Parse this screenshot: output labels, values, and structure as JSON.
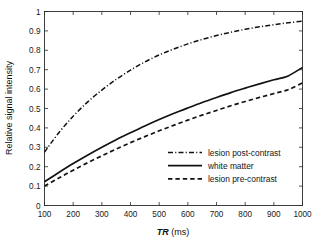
{
  "figure": {
    "background_color": "#ffffff",
    "line_color": "#121212"
  },
  "chart_data": {
    "type": "line",
    "title": "",
    "xlabel_italic": "TR",
    "xlabel_rest": " (ms)",
    "xlabel": "TR (ms)",
    "ylabel": "Relative signal intensity",
    "xlim": [
      100,
      1000
    ],
    "ylim": [
      0,
      1
    ],
    "grid": false,
    "legend_position": "lower right inside axes",
    "xticks": [
      100,
      200,
      300,
      400,
      500,
      600,
      700,
      800,
      900,
      1000
    ],
    "xticklabels": [
      "100",
      "200",
      "300",
      "400",
      "500",
      "600",
      "700",
      "800",
      "900",
      "1000"
    ],
    "yticks": [
      0,
      0.1,
      0.2,
      0.3,
      0.4,
      0.5,
      0.6,
      0.7,
      0.8,
      0.9,
      1
    ],
    "yticklabels": [
      "0",
      "0.1",
      "0.2",
      "0.3",
      "0.4",
      "0.5",
      "0.6",
      "0.7",
      "0.8",
      "0.9",
      "1"
    ],
    "x": [
      100,
      150,
      200,
      250,
      300,
      350,
      400,
      450,
      500,
      550,
      600,
      650,
      700,
      750,
      800,
      850,
      900,
      950,
      1000
    ],
    "series": [
      {
        "name": "lesion post-contrast",
        "linestyle": "dashdot",
        "values": [
          0.275,
          0.375,
          0.46,
          0.533,
          0.595,
          0.65,
          0.698,
          0.74,
          0.776,
          0.806,
          0.833,
          0.856,
          0.876,
          0.893,
          0.908,
          0.921,
          0.932,
          0.942,
          0.95
        ]
      },
      {
        "name": "white matter",
        "linestyle": "solid",
        "values": [
          0.122,
          0.17,
          0.216,
          0.259,
          0.3,
          0.339,
          0.375,
          0.41,
          0.443,
          0.474,
          0.503,
          0.531,
          0.557,
          0.582,
          0.605,
          0.627,
          0.648,
          0.668,
          0.712
        ]
      },
      {
        "name": "lesion pre-contrast",
        "linestyle": "dashed",
        "values": [
          0.1,
          0.142,
          0.182,
          0.22,
          0.256,
          0.291,
          0.324,
          0.355,
          0.385,
          0.413,
          0.44,
          0.466,
          0.49,
          0.514,
          0.536,
          0.557,
          0.577,
          0.597,
          0.632
        ]
      }
    ],
    "legend_entries": [
      {
        "label": "lesion post-contrast",
        "linestyle": "dashdot"
      },
      {
        "label": "white matter",
        "linestyle": "solid"
      },
      {
        "label": "lesion pre-contrast",
        "linestyle": "dashed"
      }
    ]
  }
}
